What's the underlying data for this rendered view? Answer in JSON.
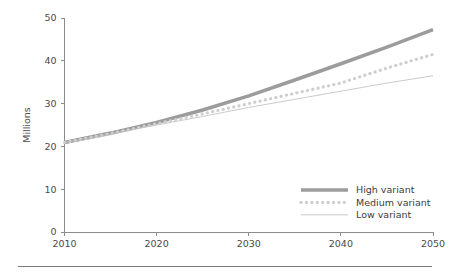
{
  "chart_data": {
    "type": "line",
    "title": "",
    "subtitle": "",
    "xlabel": "",
    "ylabel": "Millions",
    "xlim": [
      2010,
      2050
    ],
    "ylim": [
      0,
      50
    ],
    "grid": false,
    "legend_position": "lower right",
    "xticks": [
      "2010",
      "2020",
      "2030",
      "2040",
      "2050"
    ],
    "xtick_values": [
      2010,
      2020,
      2030,
      2040,
      2050
    ],
    "yticks": [
      "0",
      "10",
      "20",
      "30",
      "40",
      "50"
    ],
    "ytick_values": [
      0,
      10,
      20,
      30,
      40,
      50
    ],
    "x": [
      2010,
      2015,
      2020,
      2025,
      2030,
      2035,
      2040,
      2045,
      2050
    ],
    "series": [
      {
        "name": "High variant",
        "color": "#9c9c9c",
        "style": "thick-solid",
        "values": [
          20.9,
          23.1,
          25.6,
          28.5,
          31.8,
          35.5,
          39.3,
          43.2,
          47.3
        ]
      },
      {
        "name": "Medium variant",
        "color": "#cfcfcf",
        "style": "dotted",
        "values": [
          20.9,
          23.0,
          25.3,
          27.6,
          30.0,
          32.4,
          34.8,
          38.3,
          41.5
        ]
      },
      {
        "name": "Low variant",
        "color": "#c4c4c4",
        "style": "thin-solid",
        "values": [
          20.9,
          22.9,
          25.0,
          27.0,
          29.1,
          31.0,
          32.9,
          34.8,
          36.5
        ]
      }
    ]
  },
  "legend": {
    "items": [
      {
        "label": "High variant"
      },
      {
        "label": "Medium variant"
      },
      {
        "label": "Low variant"
      }
    ]
  },
  "axes": {
    "y_title": "Millions"
  }
}
